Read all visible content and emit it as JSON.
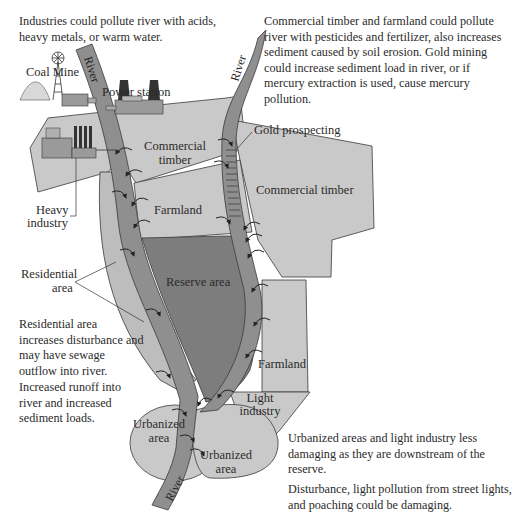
{
  "notes": {
    "industries": "Industries could pollute river with acids, heavy metals, or warm water.",
    "timber_farmland": "Commercial timber and farmland could pollute river with pesticides and fertilizer, also increases sediment caused by soil erosion. Gold mining could increase sediment load in river, or if mercury extraction is used, cause mercury pollution.",
    "residential": "Residential area increases disturbance and may have sewage outflow into river.",
    "runoff": "Increased runoff into river and increased sediment loads.",
    "urbanized": "Urbanized areas and light industry less damaging as they are downstream of the reserve.",
    "disturbance": "Disturbance, light pollution from street lights, and poaching could be damaging."
  },
  "labels": {
    "coal_mine": "Coal Mine",
    "power_station": "Power station",
    "river": "River",
    "gold_prospecting": "Gold prospecting",
    "commercial_timber_left_1": "Commercial",
    "commercial_timber_left_2": "timber",
    "commercial_timber_right": "Commercial timber",
    "heavy_industry_1": "Heavy",
    "heavy_industry_2": "industry",
    "farmland_left": "Farmland",
    "farmland_right": "Farmland",
    "residential_1": "Residential",
    "residential_2": "area",
    "reserve_area": "Reserve area",
    "light_industry_1": "Light",
    "light_industry_2": "industry",
    "urbanized_1": "Urbanized",
    "urbanized_2": "area"
  },
  "colors": {
    "land": "#c9c9c9",
    "residential": "#bdbdbd",
    "river": "#8f8f8f",
    "reserve": "#7d7d7d",
    "outline": "#3a3a3a",
    "text": "#2b2b2b"
  }
}
